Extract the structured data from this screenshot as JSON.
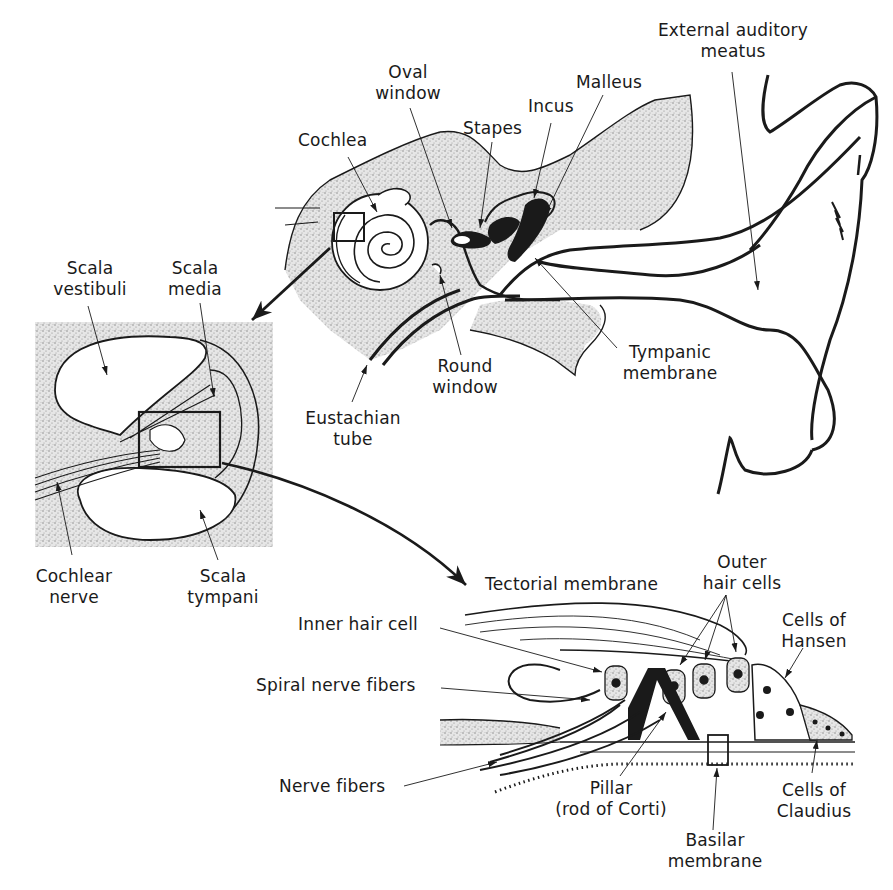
{
  "diagram": {
    "colors": {
      "ink": "#1a1a1a",
      "stipple": "#bdbdbd",
      "background": "#ffffff"
    },
    "panels": {
      "ear": {
        "labels": {
          "external_auditory_meatus": [
            "External auditory",
            "meatus"
          ],
          "oval_window": [
            "Oval",
            "window"
          ],
          "malleus": [
            "Malleus"
          ],
          "incus": [
            "Incus"
          ],
          "stapes": [
            "Stapes"
          ],
          "cochlea": [
            "Cochlea"
          ],
          "round_window": [
            "Round",
            "window"
          ],
          "tympanic_membrane": [
            "Tympanic",
            "membrane"
          ],
          "eustachian_tube": [
            "Eustachian",
            "tube"
          ]
        }
      },
      "cochlea_section": {
        "labels": {
          "scala_vestibuli": [
            "Scala",
            "vestibuli"
          ],
          "scala_media": [
            "Scala",
            "media"
          ],
          "cochlear_nerve": [
            "Cochlear",
            "nerve"
          ],
          "scala_tympani": [
            "Scala",
            "tympani"
          ]
        }
      },
      "organ_of_corti": {
        "labels": {
          "tectorial_membrane": [
            "Tectorial membrane"
          ],
          "outer_hair_cells": [
            "Outer",
            "hair cells"
          ],
          "cells_of_hansen": [
            "Cells of",
            "Hansen"
          ],
          "inner_hair_cell": [
            "Inner hair cell"
          ],
          "spiral_nerve_fibers": [
            "Spiral nerve fibers"
          ],
          "nerve_fibers": [
            "Nerve fibers"
          ],
          "pillar": [
            "Pillar",
            "(rod of Corti)"
          ],
          "basilar_membrane": [
            "Basilar",
            "membrane"
          ],
          "cells_of_claudius": [
            "Cells of",
            "Claudius"
          ]
        }
      }
    }
  }
}
